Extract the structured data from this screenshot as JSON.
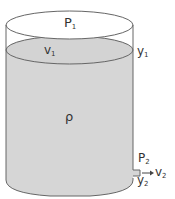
{
  "diagram": {
    "type": "tank-torricelli",
    "colors": {
      "fluid": "#d6d6d6",
      "outline": "#555555",
      "background": "#ffffff"
    },
    "labels": {
      "p1": {
        "base": "P",
        "sub": "1"
      },
      "v1": {
        "base": "v",
        "sub": "1"
      },
      "y1": {
        "base": "y",
        "sub": "1"
      },
      "rho": {
        "base": "ρ"
      },
      "p2": {
        "base": "P",
        "sub": "2"
      },
      "y2": {
        "base": "y",
        "sub": "2"
      },
      "v2": {
        "base": "v",
        "sub": "2"
      }
    }
  }
}
